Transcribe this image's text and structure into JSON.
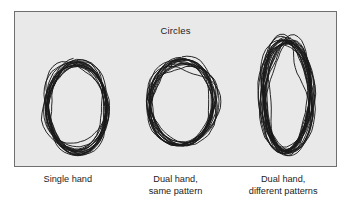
{
  "figure": {
    "title": "Circles",
    "background_color": "#e9e9e9",
    "border_color": "#6f6f6f",
    "outer_background": "#ffffff",
    "ink_color": "#1a1a1a"
  },
  "chart_data": {
    "type": "scatter",
    "title": "Circles",
    "subtitle": "",
    "xlabel": "",
    "ylabel": "",
    "grid": false,
    "legend_position": "none",
    "categories": [
      "Single hand",
      "Dual hand, same pattern",
      "Dual hand, different patterns"
    ],
    "panels": [
      {
        "label_lines": [
          "Single hand"
        ],
        "label": "Single hand",
        "shape": "ellipse-scribble",
        "center_x": 64,
        "center_y": 98,
        "radius_x": 30,
        "radius_y": 45,
        "aspect_ratio": 0.67,
        "revolutions": 17,
        "wobble": 4.2,
        "drift_x": -5,
        "drift_y": -4,
        "seed": 11
      },
      {
        "label_lines": [
          "Dual hand,",
          "same pattern"
        ],
        "label": "Dual hand, same pattern",
        "shape": "circle-scribble",
        "center_x": 61,
        "center_y": 90,
        "radius_x": 32,
        "radius_y": 42,
        "aspect_ratio": 0.76,
        "revolutions": 16,
        "wobble": 4.6,
        "drift_x": -4,
        "drift_y": 3,
        "seed": 29
      },
      {
        "label_lines": [
          "Dual hand,",
          "different patterns"
        ],
        "label": "Dual hand, different patterns",
        "shape": "tall-ellipse-scribble",
        "center_x": 56,
        "center_y": 86,
        "radius_x": 24,
        "radius_y": 57,
        "aspect_ratio": 0.42,
        "revolutions": 21,
        "wobble": 5.0,
        "drift_x": 2,
        "drift_y": -2,
        "seed": 47
      }
    ]
  }
}
